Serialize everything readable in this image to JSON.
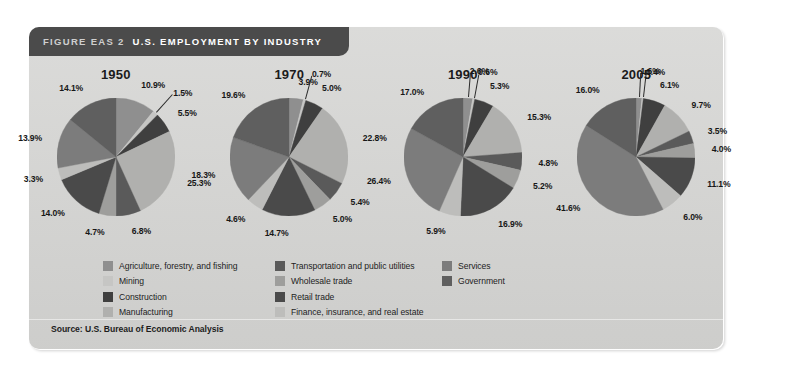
{
  "figure": {
    "label": "FIGURE EAS 2",
    "title": "U.S. EMPLOYMENT BY INDUSTRY",
    "source": "Source: U.S. Bureau of Economic Analysis",
    "panel_color": "#d4d4d2",
    "header_color": "#4b4b4b"
  },
  "legend": {
    "columns": [
      {
        "items": [
          {
            "label": "Agriculture, forestry, and fishing",
            "color": "#8f8f8f"
          },
          {
            "label": "Mining",
            "color": "#c6c6c4"
          },
          {
            "label": "Construction",
            "color": "#3f3f3f"
          },
          {
            "label": "Manufacturing",
            "color": "#b0b0ae"
          }
        ]
      },
      {
        "items": [
          {
            "label": "Transportation and public utilities",
            "color": "#5a5a5a"
          },
          {
            "label": "Wholesale trade",
            "color": "#9e9e9c"
          },
          {
            "label": "Retail trade",
            "color": "#4a4a4a"
          },
          {
            "label": "Finance, insurance, and real estate",
            "color": "#bdbdbb"
          }
        ]
      },
      {
        "items": [
          {
            "label": "Services",
            "color": "#7c7c7c"
          },
          {
            "label": "Government",
            "color": "#5f5f5f"
          }
        ]
      }
    ]
  },
  "chart_data": {
    "type": "pie",
    "title": "U.S. EMPLOYMENT BY INDUSTRY",
    "legend_position": "bottom",
    "categories": [
      "Agriculture, forestry, and fishing",
      "Mining",
      "Construction",
      "Manufacturing",
      "Transportation and public utilities",
      "Wholesale trade",
      "Retail trade",
      "Finance, insurance, and real estate",
      "Services",
      "Government"
    ],
    "colors": [
      "#8f8f8f",
      "#c6c6c4",
      "#3f3f3f",
      "#b0b0ae",
      "#5a5a5a",
      "#9e9e9c",
      "#4a4a4a",
      "#bdbdbb",
      "#7c7c7c",
      "#5f5f5f"
    ],
    "units": "percent",
    "charts": [
      {
        "title": "1950",
        "values": [
          10.9,
          1.5,
          5.5,
          25.3,
          6.8,
          4.7,
          14.0,
          3.3,
          13.9,
          14.1
        ],
        "labels": [
          "10.9%",
          "1.5%",
          "5.5%",
          "25.3%",
          "6.8%",
          "4.7%",
          "14.0%",
          "3.3%",
          "13.9%",
          "14.1%"
        ]
      },
      {
        "title": "1970",
        "values": [
          3.9,
          0.7,
          5.0,
          22.8,
          5.4,
          5.0,
          14.7,
          4.6,
          18.3,
          19.6
        ],
        "labels": [
          "3.9%",
          "0.7%",
          "5.0%",
          "22.8%",
          "5.4%",
          "5.0%",
          "14.7%",
          "4.6%",
          "18.3%",
          "19.6%"
        ]
      },
      {
        "title": "1990",
        "values": [
          2.6,
          0.6,
          5.3,
          15.3,
          4.8,
          5.2,
          16.9,
          5.9,
          26.4,
          17.0
        ],
        "labels": [
          "2.6%",
          "0.6%",
          "5.3%",
          "15.3%",
          "4.8%",
          "5.2%",
          "16.9%",
          "5.9%",
          "26.4%",
          "17.0%"
        ]
      },
      {
        "title": "2005",
        "values": [
          1.6,
          0.4,
          6.1,
          9.7,
          3.5,
          4.0,
          11.1,
          6.0,
          41.6,
          16.0
        ],
        "labels": [
          "1.6%",
          "0.4%",
          "6.1%",
          "9.7%",
          "3.5%",
          "4.0%",
          "11.1%",
          "6.0%",
          "41.6%",
          "16.0%"
        ]
      }
    ]
  }
}
